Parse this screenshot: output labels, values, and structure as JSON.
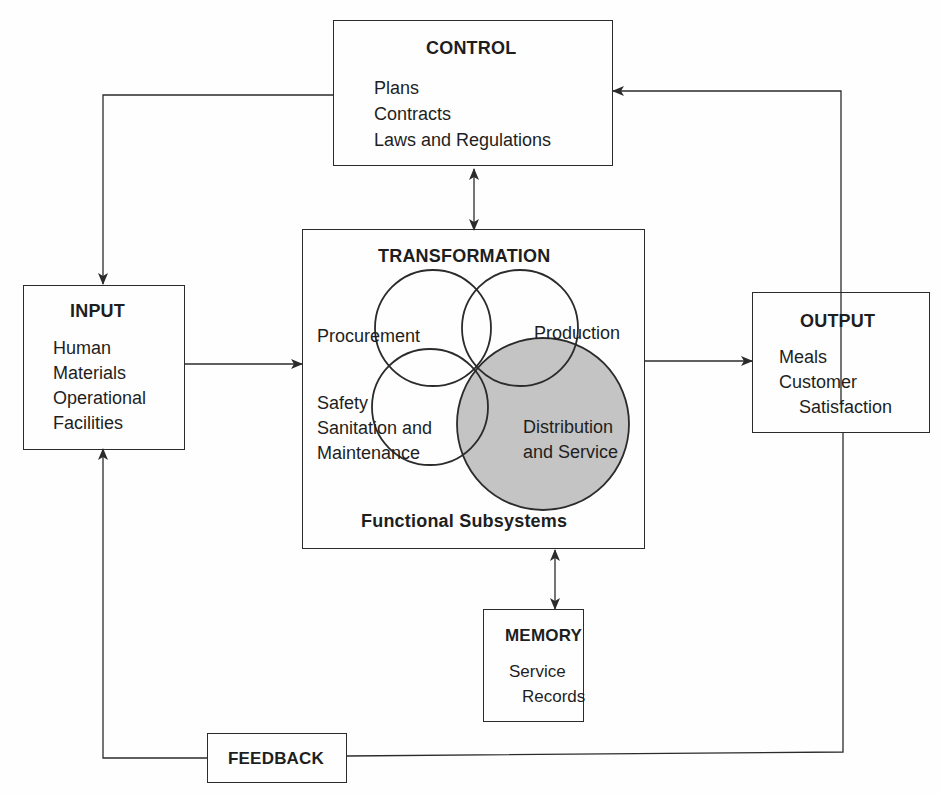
{
  "control": {
    "title": "CONTROL",
    "items": [
      "Plans",
      "Contracts",
      "Laws and Regulations"
    ]
  },
  "transformation": {
    "title": "TRANSFORMATION",
    "subtitle": "Functional Subsystems",
    "subsystems": {
      "procurement": "Procurement",
      "production": "Production",
      "safety": [
        "Safety",
        "Sanitation and",
        "Maintenance"
      ],
      "distribution": [
        "Distribution",
        "and Service"
      ]
    }
  },
  "input": {
    "title": "INPUT",
    "items": [
      "Human",
      "Materials",
      "Operational",
      "Facilities"
    ]
  },
  "output": {
    "title": "OUTPUT",
    "items": [
      "Meals",
      "Customer",
      "Satisfaction"
    ]
  },
  "memory": {
    "title": "MEMORY",
    "items": [
      "Service",
      "Records"
    ]
  },
  "feedback": {
    "title": "FEEDBACK"
  },
  "colors": {
    "line": "#2b2b2b",
    "shaded_circle": "#c4c4c4",
    "background": "#fefefe"
  }
}
